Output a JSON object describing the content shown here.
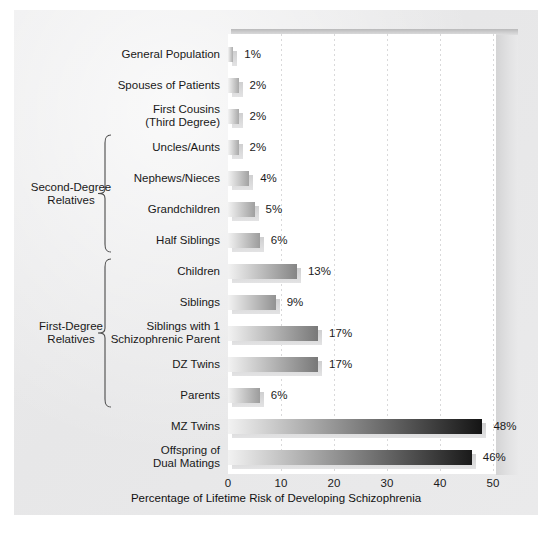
{
  "chart_data": {
    "type": "bar",
    "orientation": "horizontal",
    "title": "",
    "xlabel": "Percentage of Lifetime Risk of Developing Schizophrenia",
    "ylabel": "",
    "xlim": [
      0,
      55
    ],
    "xticks": [
      0,
      10,
      20,
      30,
      40,
      50
    ],
    "xtick_labels": [
      "0",
      "10",
      "20",
      "30",
      "40",
      "50"
    ],
    "grid": true,
    "grid_axis": "x",
    "legend": "none",
    "value_label_suffix": "%",
    "categories": [
      "General Population",
      "Spouses of Patients",
      "First Cousins\n(Third Degree)",
      "Uncles/Aunts",
      "Nephews/Nieces",
      "Grandchildren",
      "Half Siblings",
      "Children",
      "Siblings",
      "Siblings with 1\nSchizophrenic Parent",
      "DZ Twins",
      "Parents",
      "MZ Twins",
      "Offspring of\nDual Matings"
    ],
    "values": [
      1,
      2,
      2,
      2,
      4,
      5,
      6,
      13,
      9,
      17,
      17,
      6,
      48,
      46
    ],
    "value_labels": [
      "1%",
      "2%",
      "2%",
      "2%",
      "4%",
      "5%",
      "6%",
      "13%",
      "9%",
      "17%",
      "17%",
      "6%",
      "48%",
      "46%"
    ],
    "groups": [
      {
        "label": "Second-Degree\nRelatives",
        "first_index": 3,
        "last_index": 6
      },
      {
        "label": "First-Degree\nRelatives",
        "first_index": 7,
        "last_index": 11
      }
    ]
  },
  "colors": {
    "panel_background": "#eaeaeb",
    "plot_background": "#ffffff",
    "bar_gradient_start": "#f2f2f2",
    "bar_gradient_end": "#141414",
    "bar_shadow": "#d4d4d5",
    "gridline": "#d9d9da",
    "text": "#191919"
  }
}
